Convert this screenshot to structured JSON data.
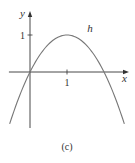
{
  "chart_data": {
    "type": "line",
    "title": "",
    "caption": "(c)",
    "xlabel": "x",
    "ylabel": "y",
    "xlim": [
      -0.57,
      2.65
    ],
    "ylim": [
      -1.52,
      1.6
    ],
    "x_ticks": [
      {
        "value": 1,
        "label": "1"
      }
    ],
    "y_ticks": [
      {
        "value": 1,
        "label": "1"
      }
    ],
    "grid": false,
    "series": [
      {
        "name": "h",
        "label": "h",
        "function": "h(x) = 2x - x^2",
        "x": [
          -0.55,
          -0.25,
          0,
          0.25,
          0.5,
          0.75,
          1,
          1.25,
          1.5,
          1.75,
          2,
          2.25,
          2.55
        ],
        "y": [
          -1.4025,
          -0.5625,
          0,
          0.4375,
          0.75,
          0.9375,
          1,
          0.9375,
          0.75,
          0.4375,
          0,
          -0.5625,
          -1.4025
        ],
        "label_at": {
          "x": 1.55,
          "y": 1.08
        },
        "color": "#777777"
      }
    ],
    "axis_color": "#333333"
  }
}
